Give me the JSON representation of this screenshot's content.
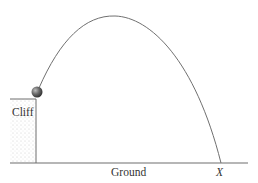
{
  "diagram": {
    "type": "projectile-from-cliff",
    "labels": {
      "cliff": "Cliff",
      "ground": "Ground",
      "landing_point": "X"
    },
    "colors": {
      "line": "#6e6e6e",
      "ball": "#4a4a4a",
      "stipple": "#c8c8c8",
      "text": "#333333"
    }
  }
}
